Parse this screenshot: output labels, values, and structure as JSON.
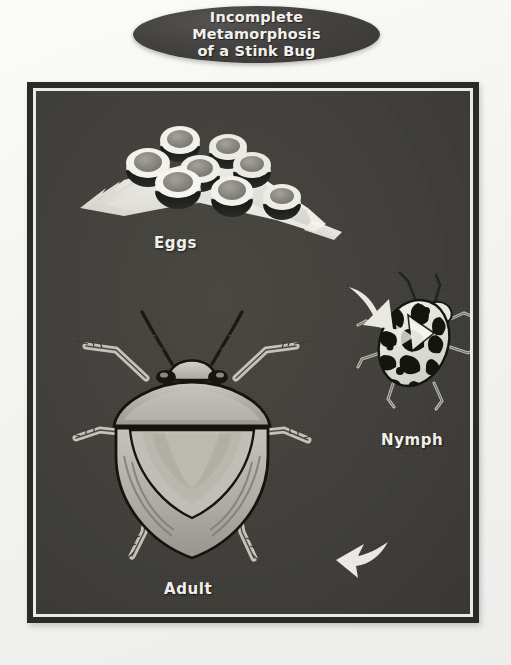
{
  "poster": {
    "title_line1": "Incomplete Metamorphosis",
    "title_line2": "of a Stink Bug",
    "title_full": "Incomplete Metamorphosis\nof a Stink Bug",
    "page_background_color": "#f4f4f3",
    "frame_border_color": "#2a2a28",
    "frame_inner_line_color": "#e9e9e6",
    "scene_background_color": "#3e3d38",
    "label_color": "#f0efec"
  },
  "stages": [
    {
      "id": "eggs",
      "label": "Eggs",
      "description": "Cluster of barrel-shaped eggs on a pale leaf blade",
      "egg_count": 8
    },
    {
      "id": "nymph",
      "label": "Nymph",
      "description": "Rounded black-and-white patterned immature stink bug",
      "legs": 6,
      "antennae": 2
    },
    {
      "id": "adult",
      "label": "Adult",
      "description": "Shield-shaped adult stink bug with wings folded",
      "legs": 6,
      "antennae": 2
    }
  ],
  "arrows": [
    {
      "id": "eggs-to-nymph",
      "from": "eggs",
      "to": "nymph",
      "direction": "down-right",
      "color": "#e6e5e0"
    },
    {
      "id": "nymph-to-adult",
      "from": "nymph",
      "to": "adult",
      "direction": "down-left",
      "color": "#e6e5e0"
    }
  ],
  "colors": {
    "egg_rim": "#efeee9",
    "egg_top": "#8d8c86",
    "egg_band": "#171714",
    "leaf": "#e4e3dd",
    "nymph_light": "#f0efe9",
    "nymph_dark": "#131311",
    "adult_body": "#b9b8b1",
    "adult_shadow": "#8e8d86",
    "adult_outline": "#16150f",
    "leg": "#c9c8c1"
  }
}
